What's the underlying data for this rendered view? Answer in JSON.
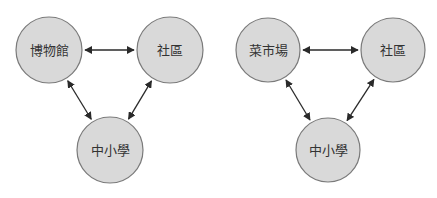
{
  "diagrams": [
    {
      "name": "left",
      "nodes": [
        {
          "id": "a",
          "label": "博物館",
          "cx": 49,
          "cy": 50,
          "r": 33
        },
        {
          "id": "b",
          "label": "社區",
          "cx": 170,
          "cy": 50,
          "r": 33
        },
        {
          "id": "c",
          "label": "中小學",
          "cx": 110,
          "cy": 150,
          "r": 33
        }
      ],
      "edges": [
        {
          "from": "a",
          "to": "b",
          "bidirectional": true
        },
        {
          "from": "a",
          "to": "c",
          "bidirectional": true
        },
        {
          "from": "b",
          "to": "c",
          "bidirectional": true
        }
      ]
    },
    {
      "name": "right",
      "nodes": [
        {
          "id": "a",
          "label": "菜市場",
          "cx": 268,
          "cy": 50,
          "r": 32
        },
        {
          "id": "b",
          "label": "社區",
          "cx": 393,
          "cy": 50,
          "r": 32
        },
        {
          "id": "c",
          "label": "中小學",
          "cx": 328,
          "cy": 150,
          "r": 32
        }
      ],
      "edges": [
        {
          "from": "a",
          "to": "b",
          "bidirectional": true
        },
        {
          "from": "a",
          "to": "c",
          "bidirectional": true
        },
        {
          "from": "b",
          "to": "c",
          "bidirectional": true
        }
      ]
    }
  ],
  "colors": {
    "node_fill": "#d9d9d9",
    "node_stroke": "#7a7a7a",
    "edge": "#2a2a2a",
    "text": "#333333",
    "background": "#ffffff"
  }
}
